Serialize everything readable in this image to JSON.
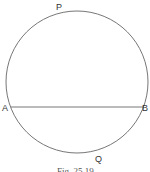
{
  "figure": {
    "caption": "Fig. 25.19",
    "labels": {
      "P": "P",
      "A": "A",
      "B": "B",
      "Q": "Q"
    },
    "circle": {
      "cx": 77,
      "cy": 82,
      "r": 71
    },
    "chord": {
      "from": "A",
      "to": "B"
    },
    "stroke_color": "#555555"
  }
}
